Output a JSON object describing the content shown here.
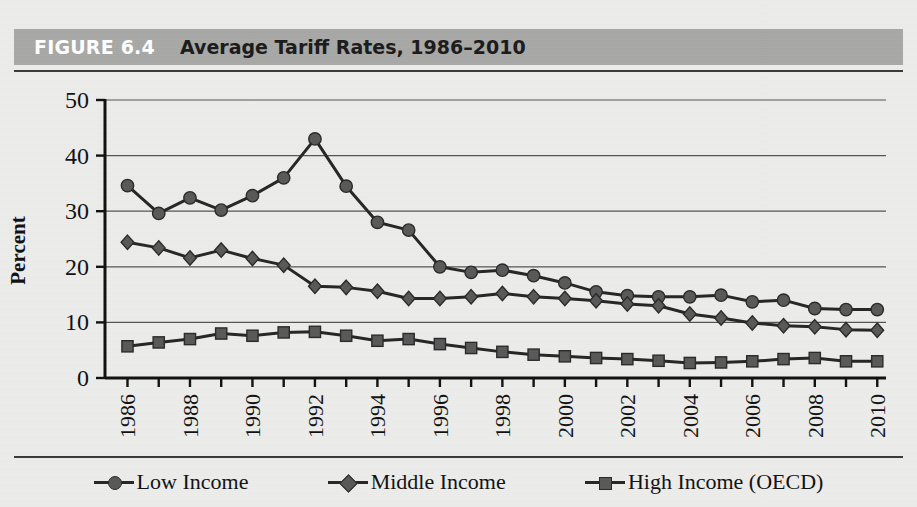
{
  "figure": {
    "number_label": "FIGURE 6.4",
    "title": "Average Tariff Rates, 1986–2010"
  },
  "colors": {
    "header_band": "#a8a8a6",
    "page_background": "#ececeb",
    "rule": "#3a3a3a",
    "line": "#262626",
    "marker_fill": "#595959",
    "marker_stroke": "#2a2a2a",
    "gridline": "#555555",
    "axis": "#111111"
  },
  "legend": {
    "position": "bottom",
    "items": [
      {
        "label": "Low Income",
        "marker": "circle"
      },
      {
        "label": "Middle Income",
        "marker": "diamond"
      },
      {
        "label": "High Income (OECD)",
        "marker": "square"
      }
    ]
  },
  "chart_data": {
    "type": "line",
    "title": "Average Tariff Rates, 1986–2010",
    "xlabel": "",
    "ylabel": "Percent",
    "ylim": [
      0,
      50
    ],
    "yticks": [
      0,
      10,
      20,
      30,
      40,
      50
    ],
    "ytick_labels": [
      "0",
      "10",
      "20",
      "30",
      "40",
      "50"
    ],
    "grid": true,
    "x": [
      1986,
      1987,
      1988,
      1989,
      1990,
      1991,
      1992,
      1993,
      1994,
      1995,
      1996,
      1997,
      1998,
      1999,
      2000,
      2001,
      2002,
      2003,
      2004,
      2005,
      2006,
      2007,
      2008,
      2009,
      2010
    ],
    "xtick_labels": [
      "1986",
      "",
      "1988",
      "",
      "1990",
      "",
      "1992",
      "",
      "1994",
      "",
      "1996",
      "",
      "1998",
      "",
      "2000",
      "",
      "2002",
      "",
      "2004",
      "",
      "2006",
      "",
      "2008",
      "",
      "2010"
    ],
    "series": [
      {
        "name": "Low Income",
        "marker": "circle",
        "values": [
          34.6,
          29.6,
          32.4,
          30.2,
          32.8,
          36.0,
          43.0,
          34.5,
          28.0,
          26.6,
          20.0,
          19.0,
          19.4,
          18.4,
          17.1,
          15.5,
          14.8,
          14.6,
          14.6,
          14.9,
          13.7,
          14.0,
          12.5,
          12.3,
          12.3
        ]
      },
      {
        "name": "Middle Income",
        "marker": "diamond",
        "values": [
          24.4,
          23.4,
          21.6,
          23.0,
          21.5,
          20.3,
          16.5,
          16.3,
          15.6,
          14.3,
          14.3,
          14.6,
          15.2,
          14.6,
          14.3,
          13.9,
          13.3,
          13.0,
          11.5,
          10.8,
          9.9,
          9.4,
          9.2,
          8.7,
          8.6
        ]
      },
      {
        "name": "High Income (OECD)",
        "marker": "square",
        "values": [
          5.7,
          6.4,
          7.0,
          8.0,
          7.6,
          8.2,
          8.3,
          7.6,
          6.7,
          7.0,
          6.1,
          5.4,
          4.7,
          4.2,
          3.9,
          3.6,
          3.4,
          3.1,
          2.7,
          2.8,
          3.0,
          3.4,
          3.6,
          3.0,
          3.0
        ]
      }
    ]
  }
}
